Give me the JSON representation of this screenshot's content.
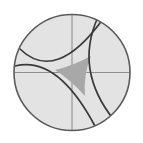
{
  "figure": {
    "caption": "",
    "width": 143,
    "height": 143,
    "background_color": "#ffffff"
  },
  "chart_data": {
    "type": "diagram",
    "diagram_kind": "poincare-disk",
    "xlabel": "",
    "ylabel": "",
    "grid": false,
    "legend": null,
    "annotations": [],
    "colors": {
      "disk_fill": "#e3e3e3",
      "disk_stroke": "#5a5a5a",
      "axis_stroke": "#8f8f8f",
      "geodesic_stroke": "#3a3a3a",
      "triangle_fill": "#a8a8a8",
      "background": "#ffffff"
    },
    "disk": {
      "label": "boundary-circle",
      "center_x": 72,
      "center_y": 72.5,
      "radius": 58,
      "stroke_width": 1.6,
      "fill": "#e3e3e3"
    },
    "axes": [
      {
        "label": "horizontal-diameter",
        "orientation": "horizontal",
        "x1": 14,
        "y1": 72.5,
        "x2": 130,
        "y2": 72.5,
        "stroke_width": 1.1
      },
      {
        "label": "vertical-diameter",
        "orientation": "vertical",
        "x1": 72,
        "y1": 14.5,
        "x2": 72,
        "y2": 130.5,
        "stroke_width": 1.1
      }
    ],
    "triangle": {
      "label": "hyperbolic-triangle",
      "vertices": [
        {
          "name": "left-vertex",
          "x": 55,
          "y": 70
        },
        {
          "name": "upper-right-vertex",
          "x": 91,
          "y": 56
        },
        {
          "name": "lower-vertex",
          "x": 85,
          "y": 96
        }
      ],
      "fill": "#a8a8a8",
      "edge_count": 3,
      "edges_are_arcs": true
    },
    "geodesics": [
      {
        "name": "geodesic-upper",
        "description": "arc from lower-left boundary through left vertex up to upper-right boundary",
        "start_x": 20,
        "start_y": 49,
        "end_x": 103,
        "end_y": 19,
        "control_x": 56,
        "control_y": 84,
        "stroke_width": 1.7
      },
      {
        "name": "geodesic-lower",
        "description": "arc from left boundary through left vertex down to lower boundary",
        "start_x": 15,
        "start_y": 66,
        "end_x": 96,
        "end_y": 128,
        "control_x": 58,
        "control_y": 55,
        "stroke_width": 1.7
      },
      {
        "name": "geodesic-right",
        "description": "arc from upper boundary down the right side of the triangle to lower-right boundary",
        "start_x": 98,
        "start_y": 17,
        "end_x": 114,
        "end_y": 120,
        "control_x": 74,
        "control_y": 70,
        "stroke_width": 1.7
      }
    ]
  }
}
